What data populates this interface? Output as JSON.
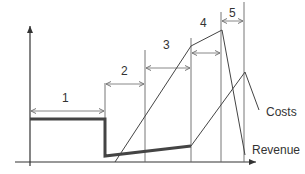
{
  "diagram": {
    "type": "phase-timeline",
    "colors": {
      "line": "#555555",
      "thick": "#444444",
      "axis": "#333333",
      "background": "#ffffff"
    },
    "phases": [
      {
        "label": "1"
      },
      {
        "label": "2"
      },
      {
        "label": "3"
      },
      {
        "label": "4"
      },
      {
        "label": "5"
      }
    ],
    "series": [
      {
        "label": "Costs"
      },
      {
        "label": "Revenue"
      }
    ]
  }
}
